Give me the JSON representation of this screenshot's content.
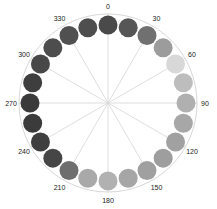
{
  "diagram": {
    "type": "polar-circle-wheel",
    "center": [
      108,
      103
    ],
    "outer_ring_radius": 89,
    "dot_orbit_radius": 78,
    "dot_radius": 9.5,
    "ring_color": "#d8d8d8",
    "spoke_color": "#d6d6d6",
    "spoke_angles": [
      0,
      30,
      60,
      90,
      120,
      150,
      180,
      210,
      240,
      270,
      300,
      330
    ],
    "labels": [
      "0",
      "30",
      "60",
      "90",
      "120",
      "150",
      "180",
      "210",
      "240",
      "270",
      "300",
      "330"
    ],
    "dots": [
      {
        "angle": 0,
        "color": "#4a4a4a"
      },
      {
        "angle": 15,
        "color": "#565656"
      },
      {
        "angle": 30,
        "color": "#707070"
      },
      {
        "angle": 45,
        "color": "#9c9c9c"
      },
      {
        "angle": 60,
        "color": "#d8d8d8"
      },
      {
        "angle": 75,
        "color": "#bdbdbd"
      },
      {
        "angle": 90,
        "color": "#b0b0b0"
      },
      {
        "angle": 105,
        "color": "#a7a7a7"
      },
      {
        "angle": 120,
        "color": "#a1a1a1"
      },
      {
        "angle": 135,
        "color": "#9e9e9e"
      },
      {
        "angle": 150,
        "color": "#a0a0a0"
      },
      {
        "angle": 165,
        "color": "#a6a6a6"
      },
      {
        "angle": 180,
        "color": "#b1b1b1"
      },
      {
        "angle": 195,
        "color": "#a9a9a9"
      },
      {
        "angle": 210,
        "color": "#6e6e6e"
      },
      {
        "angle": 225,
        "color": "#464646"
      },
      {
        "angle": 240,
        "color": "#3f3f3f"
      },
      {
        "angle": 255,
        "color": "#3b3b3b"
      },
      {
        "angle": 270,
        "color": "#3a3a3a"
      },
      {
        "angle": 285,
        "color": "#3e3e3e"
      },
      {
        "angle": 300,
        "color": "#484848"
      },
      {
        "angle": 315,
        "color": "#4d4d4d"
      },
      {
        "angle": 330,
        "color": "#505050"
      },
      {
        "angle": 345,
        "color": "#4e4e4e"
      }
    ]
  }
}
